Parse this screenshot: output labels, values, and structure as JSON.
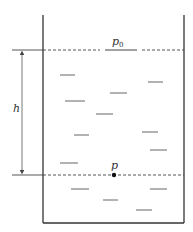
{
  "diagram": {
    "labels": {
      "surface_pressure": "p",
      "surface_pressure_subscript": "0",
      "depth": "h",
      "point_pressure": "p"
    },
    "colors": {
      "stroke": "#333333",
      "dash": "#444444",
      "dash_marks": "#555555",
      "background": "#ffffff"
    },
    "container": {
      "left_x": 43,
      "right_x": 184,
      "top_y": 15,
      "bottom_y": 223
    },
    "surface_line_y": 50,
    "point_line_y": 175,
    "point": {
      "x": 114,
      "y": 175
    },
    "depth_arrow": {
      "x": 22,
      "y1": 50,
      "y2": 175
    }
  }
}
